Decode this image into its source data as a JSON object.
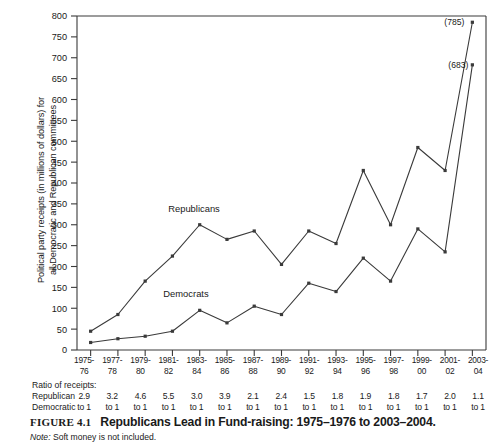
{
  "chart_data": {
    "type": "line",
    "title": "Republicans Lead in Fund-raising: 1975–1976 to 2003–2004.",
    "xlabel": "",
    "ylabel": "Political party receipts (in millions of dollars) for all Democratic and Republican committees",
    "ylabel_line1": "Political party receipts (in millions of dollars) for",
    "ylabel_line2": "all Democratic and Republican committees",
    "ylim": [
      0,
      800
    ],
    "ytick_step": 50,
    "yticks": [
      "800",
      "750",
      "700",
      "650",
      "600",
      "550",
      "500",
      "450",
      "400",
      "350",
      "300",
      "250",
      "200",
      "150",
      "100",
      "50",
      "0"
    ],
    "grid": false,
    "legend_position": "inline-labels",
    "categories": [
      "1975-76",
      "1977-78",
      "1979-80",
      "1981-82",
      "1983-84",
      "1985-86",
      "1987-88",
      "1989-90",
      "1991-92",
      "1993-94",
      "1995-96",
      "1997-98",
      "1999-00",
      "2001-02",
      "2003-04"
    ],
    "categories_top": [
      "1975-",
      "1977-",
      "1979-",
      "1981-",
      "1983-",
      "1985-",
      "1987-",
      "1989-",
      "1991-",
      "1993-",
      "1995-",
      "1997-",
      "1999-",
      "2001-",
      "2003-"
    ],
    "categories_bottom": [
      "76",
      "78",
      "80",
      "82",
      "84",
      "86",
      "88",
      "90",
      "92",
      "94",
      "96",
      "98",
      "00",
      "02",
      "04"
    ],
    "series": [
      {
        "name": "Republicans",
        "values": [
          45,
          85,
          165,
          225,
          300,
          265,
          285,
          205,
          285,
          255,
          430,
          300,
          485,
          430,
          785
        ],
        "color": "#3a3a3a",
        "end_annotation": "(785)"
      },
      {
        "name": "Democrats",
        "values": [
          18,
          27,
          33,
          45,
          95,
          65,
          105,
          85,
          160,
          140,
          220,
          165,
          290,
          235,
          683
        ],
        "color": "#3a3a3a",
        "end_annotation": "(683)"
      }
    ],
    "annotations": [
      {
        "text": "(785)",
        "series": "Republicans",
        "category": "2003-04"
      },
      {
        "text": "(683)",
        "series": "Democrats",
        "category": "2003-04"
      }
    ]
  },
  "ratio_block": {
    "title": "Ratio of receipts:",
    "row_labels": [
      "Republican",
      "Democratic"
    ],
    "numerator_values": [
      "2.9",
      "3.2",
      "4.6",
      "5.5",
      "3.0",
      "3.9",
      "2.1",
      "2.4",
      "1.5",
      "1.8",
      "1.9",
      "1.8",
      "1.7",
      "2.0",
      "1.1"
    ],
    "denominator_values": [
      "to 1",
      "to 1",
      "to 1",
      "to 1",
      "to 1",
      "to 1",
      "to 1",
      "to 1",
      "to 1",
      "to 1",
      "to 1",
      "to 1",
      "to 1",
      "to 1",
      "to 1"
    ]
  },
  "caption": {
    "figure_number": "FIGURE 4.1",
    "title": "Republicans Lead in Fund-raising: 1975–1976 to 2003–2004."
  },
  "note": {
    "label": "Note:",
    "text": "Soft money is not included."
  }
}
